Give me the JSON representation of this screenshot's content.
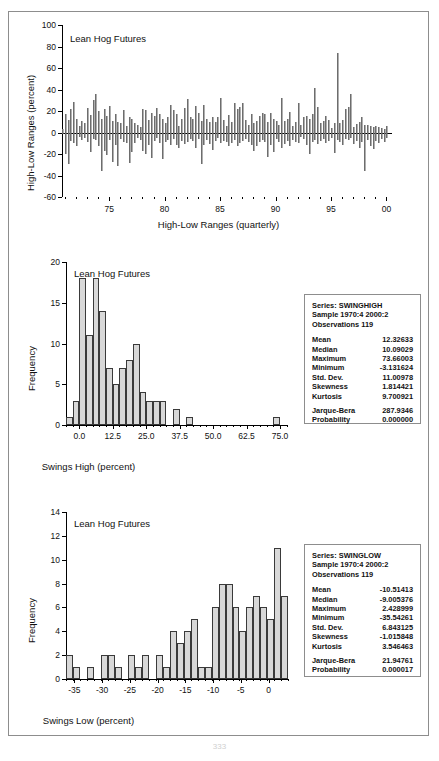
{
  "page": {
    "page_number": "333"
  },
  "figures": [
    {
      "id": "high-low-ranges",
      "note": "Lean Hog Futures",
      "ylabel": "High-Low Ranges (percent)",
      "xlabel": "High-Low Ranges (quarterly)",
      "yticks": [
        "100",
        "80",
        "60",
        "40",
        "20",
        "0",
        "-20",
        "-40",
        "-60"
      ],
      "xticks": [
        "75",
        "80",
        "85",
        "90",
        "95",
        "00"
      ],
      "chart_data": {
        "type": "bar",
        "title": "Lean Hog Futures",
        "xlabel": "High-Low Ranges (quarterly)",
        "ylabel": "High-Low Ranges (percent)",
        "ylim": [
          -60,
          100
        ],
        "xlim": [
          1970.75,
          2000.5
        ],
        "grid": false,
        "legend": "none",
        "note": "Quarterly high-low range spikes, 1970:4 - 2000:2 (119 observations). Each spike spans from the quarter low to the quarter high relative to zero.",
        "x": [
          1970.75,
          1971.0,
          1971.25,
          1971.5,
          1971.75,
          1972.0,
          1972.25,
          1972.5,
          1972.75,
          1973.0,
          1973.25,
          1973.5,
          1973.75,
          1974.0,
          1974.25,
          1974.5,
          1974.75,
          1975.0,
          1975.25,
          1975.5,
          1975.75,
          1976.0,
          1976.25,
          1976.5,
          1976.75,
          1977.0,
          1977.25,
          1977.5,
          1977.75,
          1978.0,
          1978.25,
          1978.5,
          1978.75,
          1979.0,
          1979.25,
          1979.5,
          1979.75,
          1980.0,
          1980.25,
          1980.5,
          1980.75,
          1981.0,
          1981.25,
          1981.5,
          1981.75,
          1982.0,
          1982.25,
          1982.5,
          1982.75,
          1983.0,
          1983.25,
          1983.5,
          1983.75,
          1984.0,
          1984.25,
          1984.5,
          1984.75,
          1985.0,
          1985.25,
          1985.5,
          1985.75,
          1986.0,
          1986.25,
          1986.5,
          1986.75,
          1987.0,
          1987.25,
          1987.5,
          1987.75,
          1988.0,
          1988.25,
          1988.5,
          1988.75,
          1989.0,
          1989.25,
          1989.5,
          1989.75,
          1990.0,
          1990.25,
          1990.5,
          1990.75,
          1991.0,
          1991.25,
          1991.5,
          1991.75,
          1992.0,
          1992.25,
          1992.5,
          1992.75,
          1993.0,
          1993.25,
          1993.5,
          1993.75,
          1994.0,
          1994.25,
          1994.5,
          1994.75,
          1995.0,
          1995.25,
          1995.5,
          1995.75,
          1996.0,
          1996.25,
          1996.5,
          1996.75,
          1997.0,
          1997.25,
          1997.5,
          1997.75,
          1998.0,
          1998.25,
          1998.5,
          1998.75,
          1999.0,
          1999.25,
          1999.5,
          1999.75,
          2000.0,
          2000.25
        ],
        "highs": [
          3,
          17,
          12,
          22,
          28,
          13,
          6,
          11,
          9,
          23,
          16,
          30,
          36,
          20,
          13,
          22,
          15,
          25,
          11,
          17,
          10,
          9,
          21,
          6,
          14,
          13,
          9,
          7,
          5,
          22,
          21,
          12,
          18,
          15,
          23,
          17,
          13,
          9,
          14,
          26,
          21,
          17,
          6,
          13,
          23,
          31,
          14,
          13,
          25,
          18,
          11,
          26,
          13,
          10,
          14,
          10,
          14,
          32,
          12,
          6,
          16,
          10,
          27,
          22,
          24,
          27,
          12,
          7,
          17,
          9,
          11,
          15,
          18,
          17,
          10,
          18,
          13,
          11,
          7,
          32,
          11,
          13,
          19,
          6,
          10,
          27,
          7,
          14,
          15,
          13,
          17,
          41,
          24,
          9,
          11,
          15,
          12,
          4,
          9,
          74,
          9,
          12,
          22,
          24,
          36,
          5,
          8,
          10,
          14,
          7,
          7,
          6,
          5,
          6,
          5,
          4,
          3,
          6
        ],
        "lows": [
          -1,
          -20,
          -29,
          -8,
          -10,
          -13,
          -4,
          -7,
          -5,
          -9,
          -18,
          -6,
          -7,
          -13,
          -36,
          -17,
          -21,
          -7,
          -27,
          -12,
          -31,
          -6,
          -9,
          -10,
          -28,
          -18,
          -10,
          -5,
          -7,
          -17,
          -20,
          -12,
          -24,
          -8,
          -5,
          -10,
          -25,
          -9,
          -7,
          -12,
          -6,
          -12,
          -14,
          -8,
          -11,
          -9,
          -6,
          -8,
          -14,
          -6,
          -29,
          -12,
          -7,
          -11,
          -16,
          -8,
          -5,
          -10,
          -8,
          -9,
          -13,
          -10,
          -7,
          -13,
          -10,
          -8,
          -6,
          -9,
          -12,
          -17,
          -13,
          -9,
          -7,
          -9,
          -23,
          -12,
          -18,
          -6,
          -9,
          -14,
          -11,
          -8,
          -13,
          -7,
          -9,
          -10,
          -4,
          -6,
          -12,
          -20,
          -9,
          -7,
          -11,
          -8,
          -6,
          -10,
          -8,
          -5,
          -19,
          -7,
          -9,
          -12,
          -6,
          -7,
          -5,
          -11,
          -8,
          -14,
          -9,
          -36,
          -7,
          -13,
          -15,
          -8,
          -10,
          -6,
          -9,
          -5
        ]
      }
    },
    {
      "id": "swings-high",
      "note": "Lean Hog Futures",
      "ylabel": "Frequency",
      "xlabel": "Swings High (percent)",
      "yticks": [
        "20",
        "15",
        "10",
        "5",
        "0"
      ],
      "xticks": [
        "0.0",
        "12.5",
        "25.0",
        "37.5",
        "50.0",
        "62.5",
        "75.0"
      ],
      "stats": {
        "series_label": "Series: SWINGHIGH",
        "sample_label": "Sample 1970:4 2000:2",
        "observations_label": "Observations 119",
        "rows": [
          {
            "key": "Mean",
            "value": "12.32633"
          },
          {
            "key": "Median",
            "value": "10.09029"
          },
          {
            "key": "Maximum",
            "value": "73.66003"
          },
          {
            "key": "Minimum",
            "value": "-3.131624"
          },
          {
            "key": "Std. Dev.",
            "value": "11.00978"
          },
          {
            "key": "Skewness",
            "value": "1.814421"
          },
          {
            "key": "Kurtosis",
            "value": "9.700921"
          }
        ],
        "tests": [
          {
            "key": "Jarque-Bera",
            "value": "287.9346"
          },
          {
            "key": "Probability",
            "value": "0.000000"
          }
        ]
      },
      "chart_data": {
        "type": "bar",
        "title": "Lean Hog Futures",
        "xlabel": "Swings High (percent)",
        "ylabel": "Frequency",
        "ylim": [
          0,
          20
        ],
        "xlim": [
          -5.0,
          78.0
        ],
        "grid": false,
        "legend": "none",
        "bin_width": 2.5,
        "bin_centers": [
          -3.75,
          -1.25,
          1.25,
          3.75,
          6.25,
          8.75,
          11.25,
          13.75,
          16.25,
          18.75,
          21.25,
          23.75,
          26.25,
          28.75,
          31.25,
          36.25,
          41.25,
          73.75
        ],
        "bin_starts": [
          -5.0,
          -2.5,
          0.0,
          2.5,
          5.0,
          7.5,
          10.0,
          12.5,
          15.0,
          17.5,
          20.0,
          22.5,
          25.0,
          27.5,
          30.0,
          35.0,
          40.0,
          72.5
        ],
        "values": [
          1,
          3,
          18,
          11,
          18,
          14,
          7,
          5,
          7,
          8,
          10,
          4,
          3,
          3,
          3,
          2,
          1,
          1
        ]
      }
    },
    {
      "id": "swings-low",
      "note": "Lean Hog Futures",
      "ylabel": "Frequency",
      "xlabel": "Swings Low (percent)",
      "yticks": [
        "14",
        "12",
        "10",
        "8",
        "6",
        "4",
        "2",
        "0"
      ],
      "xticks": [
        "-35",
        "-30",
        "-25",
        "-20",
        "-15",
        "-10",
        "-5",
        "0"
      ],
      "stats": {
        "series_label": "Series: SWINGLOW",
        "sample_label": "Sample 1970:4 2000:2",
        "observations_label": "Observations 119",
        "rows": [
          {
            "key": "Mean",
            "value": "-10.51413"
          },
          {
            "key": "Median",
            "value": "-9.005376"
          },
          {
            "key": "Maximum",
            "value": "2.428999"
          },
          {
            "key": "Minimum",
            "value": "-35.54261"
          },
          {
            "key": "Std. Dev.",
            "value": "6.843125"
          },
          {
            "key": "Skewness",
            "value": "-1.015848"
          },
          {
            "key": "Kurtosis",
            "value": "3.546463"
          }
        ],
        "tests": [
          {
            "key": "Jarque-Bera",
            "value": "21.94761"
          },
          {
            "key": "Probability",
            "value": "0.000017"
          }
        ]
      },
      "chart_data": {
        "type": "bar",
        "title": "Lean Hog Futures",
        "xlabel": "Swings Low (percent)",
        "ylabel": "Frequency",
        "ylim": [
          0,
          14
        ],
        "xlim": [
          -36.5,
          3.5
        ],
        "grid": false,
        "legend": "none",
        "bin_width": 1.25,
        "bin_starts": [
          -36.5,
          -35.25,
          -34.0,
          -32.75,
          -31.5,
          -30.25,
          -29.0,
          -27.75,
          -26.5,
          -25.25,
          -24.0,
          -22.75,
          -21.5,
          -20.25,
          -19.0,
          -17.75,
          -16.5,
          -15.25,
          -14.0,
          -12.75,
          -11.5,
          -10.25,
          -9.0,
          -7.75,
          -6.5,
          -5.25,
          -4.0,
          -2.75,
          -1.5,
          -0.25,
          1.0,
          2.25
        ],
        "values": [
          2,
          1,
          0,
          1,
          0,
          2,
          2,
          1,
          0,
          2,
          1,
          2,
          0,
          2,
          1,
          4,
          3,
          4,
          5,
          1,
          1,
          6,
          8,
          8,
          6,
          4,
          6,
          7,
          6,
          5,
          11,
          7,
          1,
          0,
          1
        ]
      }
    }
  ]
}
